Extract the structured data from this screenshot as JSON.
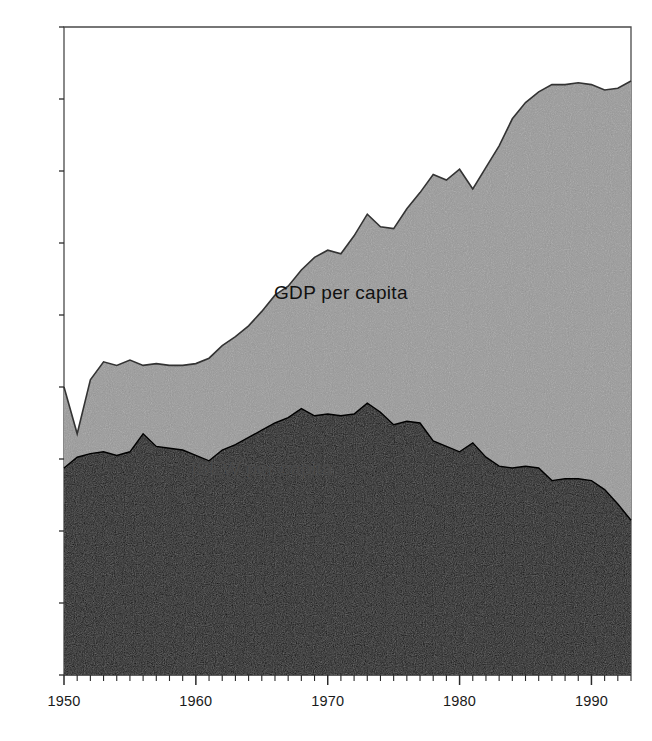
{
  "chart_data": {
    "type": "area",
    "title": "",
    "subtitle": "",
    "xlabel": "",
    "ylabel": "",
    "stacked": false,
    "overlaid": true,
    "grid": false,
    "legend_position": "inline-annotation",
    "xlim": [
      1950,
      1993
    ],
    "ylim": [
      0,
      18000
    ],
    "x_tick_labels": [
      "1950",
      "1960",
      "1970",
      "1980",
      "1990"
    ],
    "x_tick_values": [
      1950,
      1960,
      1970,
      1980,
      1990
    ],
    "x_minor_tick_interval": 1,
    "y_tick_labels": [
      "0",
      "2.000",
      "4.000",
      "6.000",
      "8.000",
      "10.000",
      "12.000",
      "14.000",
      "16.000",
      "18.000"
    ],
    "y_tick_values": [
      0,
      2000,
      4000,
      6000,
      8000,
      10000,
      12000,
      14000,
      16000,
      18000
    ],
    "thousands_separator": ".",
    "x": [
      1950,
      1951,
      1952,
      1953,
      1954,
      1955,
      1956,
      1957,
      1958,
      1959,
      1960,
      1961,
      1962,
      1963,
      1964,
      1965,
      1966,
      1967,
      1968,
      1969,
      1970,
      1971,
      1972,
      1973,
      1974,
      1975,
      1976,
      1977,
      1978,
      1979,
      1980,
      1981,
      1982,
      1983,
      1984,
      1985,
      1986,
      1987,
      1988,
      1989,
      1990,
      1991,
      1992,
      1993
    ],
    "series": [
      {
        "name": "GDP per capita",
        "color": "#999999",
        "edge_color": "#333333",
        "label_color": "#111111",
        "label_x_year": 1971,
        "label_y_value": 10450,
        "values": [
          8000,
          6700,
          8200,
          8700,
          8600,
          8750,
          8600,
          8650,
          8600,
          8600,
          8650,
          8800,
          9150,
          9400,
          9700,
          10100,
          10550,
          10800,
          11250,
          11600,
          11800,
          11700,
          12200,
          12800,
          12450,
          12400,
          12950,
          13400,
          13900,
          13750,
          14050,
          13500,
          14100,
          14700,
          15450,
          15900,
          16200,
          16400,
          16400,
          16450,
          16400,
          16250,
          16300,
          16500
        ]
      },
      {
        "name": "ISEW per capita",
        "color": "#0d0d0d",
        "edge_color": "#000000",
        "label_color": "#4a4a4a",
        "label_x_year": 1965,
        "label_y_value": 5550,
        "values": [
          5750,
          6050,
          6150,
          6200,
          6100,
          6200,
          6700,
          6350,
          6300,
          6250,
          6100,
          5950,
          6250,
          6400,
          6600,
          6800,
          7000,
          7150,
          7400,
          7200,
          7250,
          7200,
          7250,
          7550,
          7300,
          6950,
          7050,
          7000,
          6500,
          6350,
          6200,
          6450,
          6050,
          5800,
          5750,
          5800,
          5750,
          5400,
          5450,
          5450,
          5400,
          5150,
          4750,
          4300
        ]
      }
    ],
    "annotations": [
      {
        "text": "GDP per capita",
        "series": "GDP per capita"
      },
      {
        "text": "ISEW per capita",
        "series": "ISEW per capita"
      }
    ]
  }
}
